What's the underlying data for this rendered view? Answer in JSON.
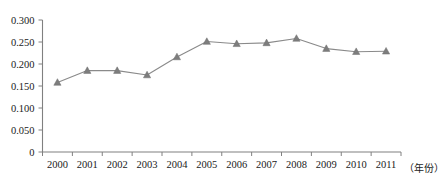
{
  "chart_data": {
    "type": "line",
    "title": "",
    "subtitle": "",
    "xlabel": "（年份）",
    "ylabel": "",
    "categories": [
      "2000",
      "2001",
      "2002",
      "2003",
      "2004",
      "2005",
      "2006",
      "2007",
      "2008",
      "2009",
      "2010",
      "2011"
    ],
    "values": [
      0.158,
      0.185,
      0.185,
      0.175,
      0.216,
      0.251,
      0.246,
      0.248,
      0.258,
      0.235,
      0.228,
      0.229
    ],
    "series": [
      {
        "name": "",
        "values": [
          0.158,
          0.185,
          0.185,
          0.175,
          0.216,
          0.251,
          0.246,
          0.248,
          0.258,
          0.235,
          0.228,
          0.229
        ]
      }
    ],
    "ylim": [
      0,
      0.3
    ],
    "ytick_labels": [
      "0.300",
      "0.250",
      "0.200",
      "0.150",
      "0.100",
      "0.050",
      "0"
    ],
    "ytick_values": [
      0.3,
      0.25,
      0.2,
      0.15,
      0.1,
      0.05,
      0
    ],
    "grid": false,
    "legend": "none",
    "marker": "triangle",
    "line_color": "#8a8a8a",
    "marker_color": "#7d7d7d",
    "axis_color": "#808080",
    "background_color": "#ffffff"
  },
  "axis_caption": "（年份）"
}
